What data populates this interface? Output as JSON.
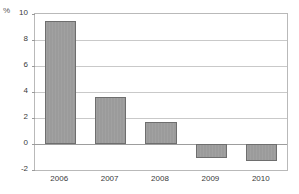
{
  "chart_data": {
    "type": "bar",
    "title": "",
    "subtitle": "",
    "xlabel": "",
    "ylabel": "%",
    "unit_label": "%",
    "categories": [
      "2006",
      "2007",
      "2008",
      "2009",
      "2010"
    ],
    "values": [
      9.5,
      3.6,
      1.7,
      -1.1,
      -1.3
    ],
    "series": [
      {
        "name": "",
        "values": [
          9.5,
          3.6,
          1.7,
          -1.1,
          -1.3
        ]
      }
    ],
    "ylim": [
      -2,
      10
    ],
    "yticks": [
      -2,
      0,
      2,
      4,
      6,
      8,
      10
    ],
    "ytick_labels": [
      "-2",
      "0",
      "2",
      "4",
      "6",
      "8",
      "10"
    ],
    "grid": true,
    "grid_axis": "y",
    "legend": false,
    "legend_position": "none",
    "annotations": [],
    "colors": {
      "bar_fill": "#9b9b9b",
      "bar_border": "#6e6e6e",
      "gridline": "#c9c9c9",
      "zero_line": "#9d9d9d",
      "frame": "#b9b9b9",
      "tick_text": "#3a3a3a",
      "unit_text": "#555555",
      "background": "#ffffff"
    }
  },
  "axis": {
    "y": {
      "unit": "%",
      "ticks": [
        {
          "value": 10,
          "label": "10"
        },
        {
          "value": 8,
          "label": "8"
        },
        {
          "value": 6,
          "label": "6"
        },
        {
          "value": 4,
          "label": "4"
        },
        {
          "value": 2,
          "label": "2"
        },
        {
          "value": 0,
          "label": "0"
        },
        {
          "value": -2,
          "label": "-2"
        }
      ]
    },
    "x": {
      "ticks": [
        {
          "label": "2006"
        },
        {
          "label": "2007"
        },
        {
          "label": "2008"
        },
        {
          "label": "2009"
        },
        {
          "label": "2010"
        }
      ]
    }
  },
  "bars": [
    {
      "category": "2006",
      "value": 9.5
    },
    {
      "category": "2007",
      "value": 3.6
    },
    {
      "category": "2008",
      "value": 1.7
    },
    {
      "category": "2009",
      "value": -1.1
    },
    {
      "category": "2010",
      "value": -1.3
    }
  ]
}
